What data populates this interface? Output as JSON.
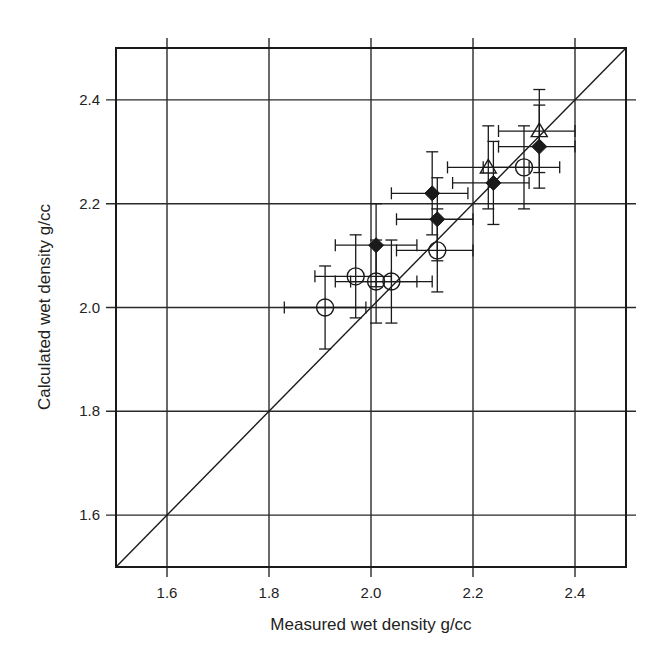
{
  "chart_data": {
    "type": "scatter",
    "title": "",
    "xlabel": "Measured wet density g/cc",
    "ylabel": "Calculated wet density g/cc",
    "xlim": [
      1.5,
      2.5
    ],
    "ylim": [
      1.5,
      2.5
    ],
    "xticks": [
      1.6,
      1.8,
      2.0,
      2.2,
      2.4
    ],
    "yticks": [
      1.6,
      1.8,
      2.0,
      2.2,
      2.4
    ],
    "xtick_labels": [
      "1.6",
      "1.8",
      "2.0",
      "2.2",
      "2.4"
    ],
    "ytick_labels": [
      "1.6",
      "1.8",
      "2.0",
      "2.2",
      "2.4"
    ],
    "grid": true,
    "legend": null,
    "reference_line": {
      "label": "1:1 line",
      "from": [
        1.5,
        1.5
      ],
      "to": [
        2.5,
        2.5
      ]
    },
    "series": [
      {
        "name": "open-circle",
        "marker": "circle-open",
        "points": [
          {
            "x": 1.91,
            "y": 2.0,
            "xerr": [
              1.83,
              1.99
            ],
            "yerr": [
              1.92,
              2.08
            ]
          },
          {
            "x": 1.97,
            "y": 2.06,
            "xerr": [
              1.89,
              2.04
            ],
            "yerr": [
              1.98,
              2.14
            ]
          },
          {
            "x": 2.01,
            "y": 2.05,
            "xerr": [
              1.93,
              2.09
            ],
            "yerr": [
              1.97,
              2.13
            ]
          },
          {
            "x": 2.04,
            "y": 2.05,
            "xerr": [
              1.96,
              2.12
            ],
            "yerr": [
              1.97,
              2.13
            ]
          },
          {
            "x": 2.13,
            "y": 2.11,
            "xerr": [
              2.05,
              2.2
            ],
            "yerr": [
              2.03,
              2.19
            ]
          },
          {
            "x": 2.3,
            "y": 2.27,
            "xerr": [
              2.22,
              2.37
            ],
            "yerr": [
              2.19,
              2.35
            ]
          }
        ]
      },
      {
        "name": "filled-diamond",
        "marker": "diamond-filled",
        "points": [
          {
            "x": 2.01,
            "y": 2.12,
            "xerr": [
              1.93,
              2.09
            ],
            "yerr": [
              2.04,
              2.2
            ]
          },
          {
            "x": 2.12,
            "y": 2.22,
            "xerr": [
              2.04,
              2.19
            ],
            "yerr": [
              2.14,
              2.3
            ]
          },
          {
            "x": 2.13,
            "y": 2.17,
            "xerr": [
              2.05,
              2.2
            ],
            "yerr": [
              2.09,
              2.25
            ]
          },
          {
            "x": 2.24,
            "y": 2.24,
            "xerr": [
              2.16,
              2.31
            ],
            "yerr": [
              2.16,
              2.32
            ]
          },
          {
            "x": 2.33,
            "y": 2.31,
            "xerr": [
              2.25,
              2.4
            ],
            "yerr": [
              2.23,
              2.39
            ]
          }
        ]
      },
      {
        "name": "open-triangle",
        "marker": "triangle-open",
        "points": [
          {
            "x": 2.23,
            "y": 2.27,
            "xerr": [
              2.15,
              2.31
            ],
            "yerr": [
              2.19,
              2.35
            ]
          },
          {
            "x": 2.33,
            "y": 2.34,
            "xerr": [
              2.25,
              2.4
            ],
            "yerr": [
              2.26,
              2.42
            ]
          }
        ]
      }
    ]
  },
  "colors": {
    "ink": "#1a1a1a",
    "grid": "#2a2a2a",
    "background": "#ffffff"
  }
}
